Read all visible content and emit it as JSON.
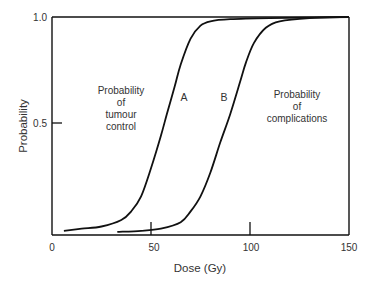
{
  "chart_data": {
    "type": "line",
    "title": "",
    "xlabel": "Dose (Gy)",
    "ylabel": "Probability",
    "xlim": [
      0,
      150
    ],
    "ylim": [
      0,
      1.0
    ],
    "grid": false,
    "legend": null,
    "x_ticks": [
      {
        "value": 0,
        "label": "0",
        "mark": false
      },
      {
        "value": 50,
        "label": "50",
        "mark": true
      },
      {
        "value": 100,
        "label": "100",
        "mark": true
      },
      {
        "value": 150,
        "label": "150",
        "mark": false
      }
    ],
    "y_ticks": [
      {
        "value": 0.5,
        "label": "0.5",
        "mark": true
      },
      {
        "value": 1.0,
        "label": "1.0",
        "mark": false
      }
    ],
    "series": [
      {
        "name": "A",
        "label": "A",
        "description": "Probability of tumour control",
        "x": [
          6,
          15,
          25,
          35,
          40,
          45,
          50,
          55,
          58,
          62,
          65,
          70,
          75,
          80,
          90,
          110,
          150
        ],
        "values": [
          0.01,
          0.02,
          0.03,
          0.06,
          0.1,
          0.17,
          0.3,
          0.45,
          0.55,
          0.68,
          0.78,
          0.9,
          0.96,
          0.98,
          0.99,
          0.995,
          1.0
        ]
      },
      {
        "name": "B",
        "label": "B",
        "description": "Probability of complications",
        "x": [
          33,
          45,
          55,
          65,
          70,
          75,
          80,
          85,
          90,
          95,
          98,
          102,
          108,
          115,
          130,
          150
        ],
        "values": [
          0.005,
          0.01,
          0.02,
          0.05,
          0.1,
          0.17,
          0.28,
          0.42,
          0.55,
          0.7,
          0.79,
          0.88,
          0.95,
          0.98,
          0.995,
          1.0
        ]
      }
    ],
    "annotations": [
      {
        "text_lines": [
          "Probability",
          "of",
          "tumour",
          "control"
        ],
        "x": 27,
        "y": 0.62
      },
      {
        "text_lines": [
          "Probability",
          "of",
          "complications"
        ],
        "x": 120,
        "y": 0.62
      },
      {
        "text": "A",
        "x": 67,
        "y": 0.63
      },
      {
        "text": "B",
        "x": 87,
        "y": 0.63
      }
    ]
  },
  "labels": {
    "ylabel": "Probability",
    "xlabel": "Dose (Gy)",
    "x0": "0",
    "x50": "50",
    "x100": "100",
    "x150": "150",
    "y05": "0.5",
    "y10": "1.0",
    "curveA": "A",
    "curveB": "B",
    "tumour": [
      "Probability",
      "of",
      "tumour",
      "control"
    ],
    "complications": [
      "Probability",
      "of",
      "complications"
    ]
  }
}
